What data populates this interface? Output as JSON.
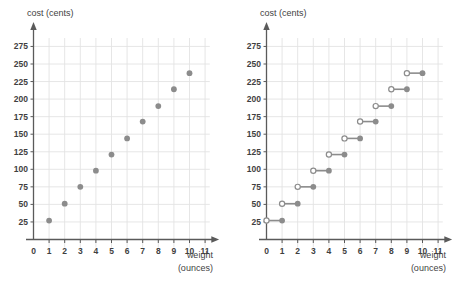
{
  "chart_data": [
    {
      "id": "left",
      "type": "scatter",
      "title": "",
      "xlabel": "weight",
      "xlabel_unit": "(ounces)",
      "ylabel": "cost (cents)",
      "xlim": [
        0,
        11
      ],
      "ylim": [
        0,
        287
      ],
      "xticks": [
        "0",
        "1",
        "2",
        "3",
        "4",
        "5",
        "6",
        "7",
        "8",
        "9",
        "10",
        "11"
      ],
      "yticks": [
        "25",
        "50",
        "75",
        "100",
        "125",
        "150",
        "175",
        "200",
        "225",
        "250",
        "275"
      ],
      "grid": true,
      "legend": "none",
      "marker_color": "#8c8c8c",
      "points": [
        {
          "x": 1,
          "y": 27
        },
        {
          "x": 2,
          "y": 51
        },
        {
          "x": 3,
          "y": 75
        },
        {
          "x": 4,
          "y": 98
        },
        {
          "x": 5,
          "y": 121
        },
        {
          "x": 6,
          "y": 144
        },
        {
          "x": 7,
          "y": 168
        },
        {
          "x": 8,
          "y": 190
        },
        {
          "x": 9,
          "y": 214
        },
        {
          "x": 10,
          "y": 237
        }
      ]
    },
    {
      "id": "right",
      "type": "line",
      "title": "",
      "xlabel": "weight",
      "xlabel_unit": "(ounces)",
      "ylabel": "cost (cents)",
      "xlim": [
        0,
        11
      ],
      "ylim": [
        0,
        287
      ],
      "xticks": [
        "0",
        "1",
        "2",
        "3",
        "4",
        "5",
        "6",
        "7",
        "8",
        "9",
        "10",
        "11"
      ],
      "yticks": [
        "25",
        "50",
        "75",
        "100",
        "125",
        "150",
        "175",
        "200",
        "225",
        "250",
        "275"
      ],
      "grid": true,
      "legend": "none",
      "marker_color": "#8c8c8c",
      "open_marker_color": "#8c8c8c",
      "segments": [
        {
          "x_open": 0,
          "x_closed": 1,
          "y": 27
        },
        {
          "x_open": 1,
          "x_closed": 2,
          "y": 51
        },
        {
          "x_open": 2,
          "x_closed": 3,
          "y": 75
        },
        {
          "x_open": 3,
          "x_closed": 4,
          "y": 98
        },
        {
          "x_open": 4,
          "x_closed": 5,
          "y": 121
        },
        {
          "x_open": 5,
          "x_closed": 6,
          "y": 144
        },
        {
          "x_open": 6,
          "x_closed": 7,
          "y": 168
        },
        {
          "x_open": 7,
          "x_closed": 8,
          "y": 190
        },
        {
          "x_open": 8,
          "x_closed": 9,
          "y": 214
        },
        {
          "x_open": 9,
          "x_closed": 10,
          "y": 237
        }
      ]
    }
  ],
  "colors": {
    "marker": "#8c8c8c",
    "grid": "#e3e3e3",
    "axis": "#5a5a5a",
    "text": "#3f3f3f"
  }
}
